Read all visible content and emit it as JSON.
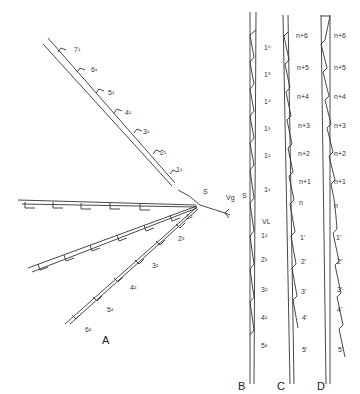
{
  "panels": {
    "A": {
      "label": "A",
      "center_labels": {
        "s": "S",
        "vg": "Vg"
      },
      "branch_upper": [
        "1¹",
        "2¹",
        "3¹",
        "4¹",
        "5¹",
        "6¹",
        "7¹"
      ],
      "branch_lower": [
        "1²",
        "2²",
        "3²",
        "4²",
        "5²",
        "6²"
      ],
      "branch_left_mirrored": [
        "2³",
        "3³",
        "4³",
        "5³",
        "6³"
      ],
      "branch_left_lower_mirrored": [
        "1⁴",
        "2⁴",
        "3⁴",
        "4⁴",
        "5⁴",
        "6⁴"
      ]
    },
    "B": {
      "label": "B",
      "side_labels": {
        "s": "S",
        "vl": "VL"
      },
      "upper": [
        "1⁶",
        "1⁵",
        "1⁴",
        "1³",
        "1²",
        "1¹"
      ],
      "lower": [
        "1²",
        "2²",
        "3²",
        "4²",
        "5²"
      ]
    },
    "C": {
      "label": "C",
      "upper": [
        "n+6",
        "n+5",
        "n+4",
        "n+3",
        "n+2",
        "n+1",
        "n"
      ],
      "lower": [
        "1'",
        "2'",
        "3'",
        "4'",
        "5'"
      ]
    },
    "D": {
      "label": "D",
      "upper": [
        "n+6",
        "n+5",
        "n+4",
        "n+3",
        "n+2",
        "n+1",
        "n"
      ],
      "lower": [
        "1'",
        "2'",
        "3'",
        "4'",
        "5'"
      ]
    }
  }
}
